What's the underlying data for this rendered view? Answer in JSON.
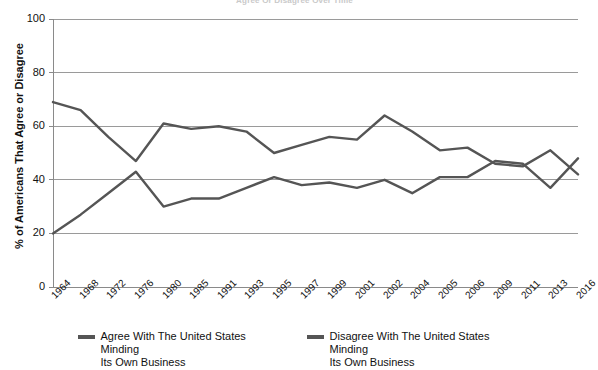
{
  "chart_data": {
    "type": "line",
    "title": "Agree Or Disagree Over Time",
    "xlabel": "",
    "ylabel": "% of Americans That Agree or Disagree",
    "ylim": [
      0,
      100
    ],
    "yticks": [
      0,
      20,
      40,
      60,
      80,
      100
    ],
    "grid": "horizontal",
    "legend_position": "bottom",
    "categories": [
      "1964",
      "1968",
      "1972",
      "1976",
      "1980",
      "1985",
      "1991",
      "1993",
      "1995",
      "1997",
      "1999",
      "2001",
      "2002",
      "2004",
      "2005",
      "2006",
      "2009",
      "2011",
      "2013",
      "2016"
    ],
    "series": [
      {
        "name": "Agree With The United States Minding Its Own Business",
        "color": "#555555",
        "values": [
          69,
          66,
          56,
          47,
          61,
          59,
          60,
          58,
          50,
          53,
          56,
          55,
          64,
          58,
          51,
          52,
          46,
          45,
          51,
          42
        ]
      },
      {
        "name": "Disagree With The United States Minding Its Own Business",
        "color": "#555555",
        "values": [
          20,
          27,
          35,
          43,
          30,
          33,
          33,
          37,
          41,
          38,
          39,
          37,
          40,
          35,
          41,
          41,
          47,
          46,
          37,
          48
        ]
      }
    ]
  },
  "legend": {
    "entries": [
      {
        "label_line1": "Agree With The United States Minding",
        "label_line2": "Its Own Business"
      },
      {
        "label_line1": "Disagree With The United States Minding",
        "label_line2": "Its Own Business"
      }
    ]
  },
  "axes": {
    "y_title": "% of Americans That Agree or Disagree"
  },
  "colors": {
    "line": "#555555",
    "grid": "#9a9a9a",
    "axis": "#8a8a8a",
    "text": "#111111"
  }
}
